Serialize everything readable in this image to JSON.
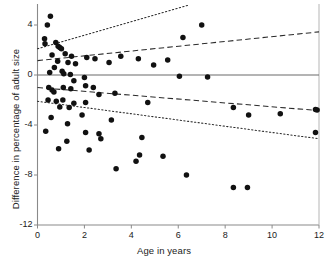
{
  "chart_data": {
    "type": "scatter",
    "title": "",
    "xlabel": "Age in years",
    "ylabel": "Difference in percentage of adult size",
    "xlim": [
      0,
      12
    ],
    "ylim": [
      -12,
      5.6
    ],
    "xticks": [
      0,
      2,
      4,
      6,
      8,
      10,
      12
    ],
    "xticklabels": [
      "0",
      "2",
      "4",
      "6",
      "8",
      "10",
      "12"
    ],
    "yticks": [
      4,
      0,
      -4,
      -8,
      -12
    ],
    "yticklabels": [
      "4",
      "0",
      "-4",
      "-8",
      "-12"
    ],
    "grid": false,
    "legend": null,
    "marker": "filled-circle",
    "marker_color": "#111111",
    "points": [
      {
        "x": 0.55,
        "y": 4.7
      },
      {
        "x": 0.42,
        "y": 4.0
      },
      {
        "x": 0.3,
        "y": 2.9
      },
      {
        "x": 0.32,
        "y": 2.5
      },
      {
        "x": 0.78,
        "y": 2.6
      },
      {
        "x": 0.88,
        "y": 2.3
      },
      {
        "x": 0.95,
        "y": 2.2
      },
      {
        "x": 1.02,
        "y": 2.1
      },
      {
        "x": 0.62,
        "y": 1.6
      },
      {
        "x": 1.18,
        "y": 1.7
      },
      {
        "x": 1.45,
        "y": 1.5
      },
      {
        "x": 0.86,
        "y": 1.1
      },
      {
        "x": 1.3,
        "y": 1.0
      },
      {
        "x": 1.62,
        "y": 0.9
      },
      {
        "x": 2.1,
        "y": 1.4
      },
      {
        "x": 2.45,
        "y": 1.3
      },
      {
        "x": 3.05,
        "y": 1.0
      },
      {
        "x": 3.55,
        "y": 1.5
      },
      {
        "x": 4.3,
        "y": 1.3
      },
      {
        "x": 5.55,
        "y": 1.2
      },
      {
        "x": 6.2,
        "y": 3.0
      },
      {
        "x": 7.0,
        "y": 4.0
      },
      {
        "x": 4.95,
        "y": 0.8
      },
      {
        "x": 0.72,
        "y": 0.6
      },
      {
        "x": 1.05,
        "y": 0.3
      },
      {
        "x": 1.12,
        "y": 0.1
      },
      {
        "x": 1.4,
        "y": 0.05
      },
      {
        "x": 0.52,
        "y": 0.2
      },
      {
        "x": 2.0,
        "y": -0.2
      },
      {
        "x": 1.55,
        "y": -0.45
      },
      {
        "x": 6.05,
        "y": -0.1
      },
      {
        "x": 7.25,
        "y": -0.15
      },
      {
        "x": 0.48,
        "y": -1.0
      },
      {
        "x": 0.62,
        "y": -1.2
      },
      {
        "x": 0.7,
        "y": -1.35
      },
      {
        "x": 1.1,
        "y": -1.0
      },
      {
        "x": 1.42,
        "y": -1.1
      },
      {
        "x": 2.05,
        "y": -0.85
      },
      {
        "x": 2.38,
        "y": -1.0
      },
      {
        "x": 2.62,
        "y": -1.55
      },
      {
        "x": 3.3,
        "y": -1.45
      },
      {
        "x": 0.45,
        "y": -2.0
      },
      {
        "x": 0.8,
        "y": -2.1
      },
      {
        "x": 1.08,
        "y": -2.0
      },
      {
        "x": 1.55,
        "y": -2.25
      },
      {
        "x": 2.05,
        "y": -2.2
      },
      {
        "x": 0.95,
        "y": -2.55
      },
      {
        "x": 1.35,
        "y": -2.6
      },
      {
        "x": 4.7,
        "y": -2.2
      },
      {
        "x": 8.35,
        "y": -2.6
      },
      {
        "x": 9.0,
        "y": -3.2
      },
      {
        "x": 10.35,
        "y": -3.1
      },
      {
        "x": 0.58,
        "y": -3.4
      },
      {
        "x": 1.9,
        "y": -3.2
      },
      {
        "x": 3.15,
        "y": -3.6
      },
      {
        "x": 1.28,
        "y": -3.9
      },
      {
        "x": 0.35,
        "y": -4.5
      },
      {
        "x": 2.05,
        "y": -4.6
      },
      {
        "x": 2.62,
        "y": -4.7
      },
      {
        "x": 2.7,
        "y": -5.1
      },
      {
        "x": 1.25,
        "y": -5.3
      },
      {
        "x": 4.45,
        "y": -5.0
      },
      {
        "x": 0.9,
        "y": -5.9
      },
      {
        "x": 2.2,
        "y": -6.0
      },
      {
        "x": 4.35,
        "y": -6.4
      },
      {
        "x": 5.35,
        "y": -6.5
      },
      {
        "x": 4.2,
        "y": -6.9
      },
      {
        "x": 3.35,
        "y": -7.5
      },
      {
        "x": 6.35,
        "y": -8.0
      },
      {
        "x": 8.35,
        "y": -9.0
      },
      {
        "x": 8.95,
        "y": -9.0
      },
      {
        "x": 11.85,
        "y": -4.6
      },
      {
        "x": 11.92,
        "y": -2.8
      },
      {
        "x": 11.85,
        "y": -2.75
      }
    ],
    "lines": [
      {
        "name": "upper-dotted-confidence-line",
        "style": "dotted",
        "x0": 0.0,
        "y0": 2.1,
        "x1": 12.0,
        "y1": 8.6
      },
      {
        "name": "upper-dashed-regression-line",
        "style": "dashed",
        "x0": 0.0,
        "y0": 1.15,
        "x1": 12.0,
        "y1": 3.45
      },
      {
        "name": "zero-reference-line",
        "style": "solid",
        "x0": 0.0,
        "y0": 0.0,
        "x1": 12.0,
        "y1": 0.0
      },
      {
        "name": "lower-dashed-regression-line",
        "style": "dashed",
        "x0": 0.0,
        "y0": -1.0,
        "x1": 12.0,
        "y1": -2.85
      },
      {
        "name": "lower-dotted-confidence-line",
        "style": "dotted",
        "x0": 0.0,
        "y0": -2.1,
        "x1": 12.0,
        "y1": -5.1
      }
    ]
  }
}
